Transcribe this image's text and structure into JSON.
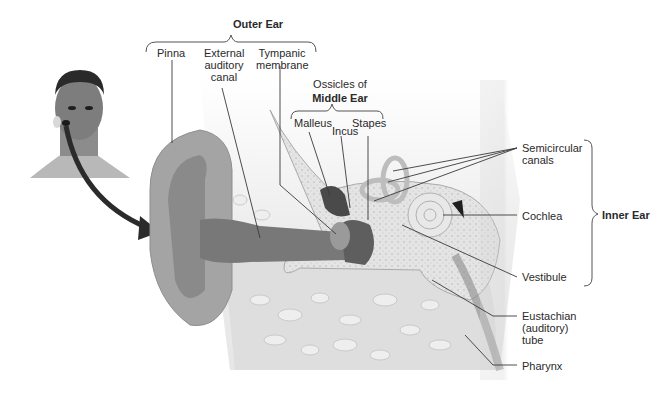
{
  "diagram": {
    "groups": {
      "outer_ear": "Outer Ear",
      "middle_ear_line1": "Ossicles of",
      "middle_ear_line2": "Middle Ear",
      "inner_ear": "Inner Ear"
    },
    "labels": {
      "pinna": "Pinna",
      "external_canal_1": "External",
      "external_canal_2": "auditory",
      "external_canal_3": "canal",
      "tympanic_1": "Tympanic",
      "tympanic_2": "membrane",
      "malleus": "Malleus",
      "incus": "Incus",
      "stapes": "Stapes",
      "semicircular_1": "Semicircular",
      "semicircular_2": "canals",
      "cochlea": "Cochlea",
      "vestibule": "Vestibule",
      "eustachian_1": "Eustachian",
      "eustachian_2": "(auditory)",
      "eustachian_3": "tube",
      "pharynx": "Pharynx"
    },
    "colors": {
      "background": "#ffffff",
      "skin": "#a8a8a8",
      "canal": "#7a7a7a",
      "bone": "#e2e2e2",
      "tissue": "#cfcfcf",
      "arrow": "#2b2b2b",
      "leader": "#3a3a3a"
    }
  }
}
